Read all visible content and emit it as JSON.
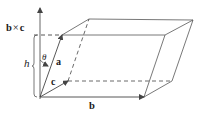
{
  "diagram": {
    "type": "parallelepiped-vector-diagram",
    "labels": {
      "cross_product": "b × c",
      "cross_b": "b",
      "cross_times": "×",
      "cross_c": "c",
      "height": "h",
      "angle": "θ",
      "vector_a": "a",
      "vector_b": "b",
      "vector_c": "c"
    },
    "points": {
      "origin": [
        40,
        97
      ],
      "b_tip": [
        144,
        97
      ],
      "c_tip": [
        68,
        81
      ],
      "a_tip": [
        62,
        35
      ],
      "a_plus_b": [
        165,
        35
      ],
      "a_plus_c": [
        89,
        19
      ],
      "a_plus_b_plus_c": [
        193,
        20
      ],
      "b_plus_c": [
        172,
        81
      ]
    },
    "colors": {
      "stroke": "#555555",
      "text": "#1a1a1a"
    }
  }
}
